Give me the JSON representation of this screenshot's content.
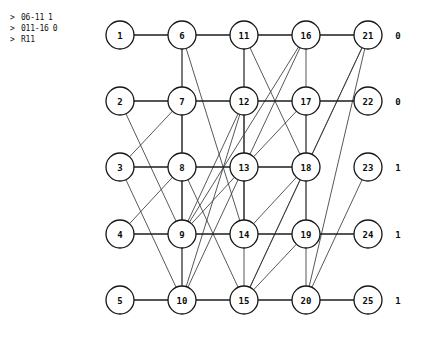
{
  "console": {
    "lines": [
      {
        "prompt": ">",
        "command": "06-11",
        "value": "1"
      },
      {
        "prompt": ">",
        "command": "011-16",
        "value": "0"
      },
      {
        "prompt": ">",
        "command": "R11",
        "value": ""
      }
    ]
  },
  "graph": {
    "title": "",
    "node_radius": 14,
    "columns": [
      120,
      182,
      244,
      306,
      368
    ],
    "rows": [
      35,
      101,
      167,
      234,
      300
    ],
    "row_labels": [
      "0",
      "0",
      "1",
      "1",
      "1"
    ],
    "nodes": [
      {
        "id": 1,
        "label": "1",
        "col": 0,
        "row": 0
      },
      {
        "id": 2,
        "label": "2",
        "col": 0,
        "row": 1
      },
      {
        "id": 3,
        "label": "3",
        "col": 0,
        "row": 2
      },
      {
        "id": 4,
        "label": "4",
        "col": 0,
        "row": 3
      },
      {
        "id": 5,
        "label": "5",
        "col": 0,
        "row": 4
      },
      {
        "id": 6,
        "label": "6",
        "col": 1,
        "row": 0
      },
      {
        "id": 7,
        "label": "7",
        "col": 1,
        "row": 1
      },
      {
        "id": 8,
        "label": "8",
        "col": 1,
        "row": 2
      },
      {
        "id": 9,
        "label": "9",
        "col": 1,
        "row": 3
      },
      {
        "id": 10,
        "label": "10",
        "col": 1,
        "row": 4
      },
      {
        "id": 11,
        "label": "11",
        "col": 2,
        "row": 0
      },
      {
        "id": 12,
        "label": "12",
        "col": 2,
        "row": 1
      },
      {
        "id": 13,
        "label": "13",
        "col": 2,
        "row": 2
      },
      {
        "id": 14,
        "label": "14",
        "col": 2,
        "row": 3
      },
      {
        "id": 15,
        "label": "15",
        "col": 2,
        "row": 4
      },
      {
        "id": 16,
        "label": "16",
        "col": 3,
        "row": 0
      },
      {
        "id": 17,
        "label": "17",
        "col": 3,
        "row": 1
      },
      {
        "id": 18,
        "label": "18",
        "col": 3,
        "row": 2
      },
      {
        "id": 19,
        "label": "19",
        "col": 3,
        "row": 3
      },
      {
        "id": 20,
        "label": "20",
        "col": 3,
        "row": 4
      },
      {
        "id": 21,
        "label": "21",
        "col": 4,
        "row": 0
      },
      {
        "id": 22,
        "label": "22",
        "col": 4,
        "row": 1
      },
      {
        "id": 23,
        "label": "23",
        "col": 4,
        "row": 2
      },
      {
        "id": 24,
        "label": "24",
        "col": 4,
        "row": 3
      },
      {
        "id": 25,
        "label": "25",
        "col": 4,
        "row": 4
      }
    ],
    "chain_edges": [
      [
        1,
        6
      ],
      [
        6,
        11
      ],
      [
        11,
        16
      ],
      [
        16,
        21
      ],
      [
        2,
        7
      ],
      [
        7,
        12
      ],
      [
        12,
        17
      ],
      [
        17,
        22
      ],
      [
        3,
        8
      ],
      [
        8,
        13
      ],
      [
        13,
        18
      ],
      [
        4,
        9
      ],
      [
        9,
        14
      ],
      [
        14,
        19
      ],
      [
        19,
        24
      ],
      [
        5,
        10
      ],
      [
        10,
        15
      ],
      [
        15,
        20
      ],
      [
        20,
        25
      ]
    ],
    "cross_edges": [
      [
        6,
        9
      ],
      [
        6,
        10
      ],
      [
        6,
        14
      ],
      [
        2,
        9
      ],
      [
        7,
        10
      ],
      [
        7,
        3
      ],
      [
        11,
        14
      ],
      [
        11,
        15
      ],
      [
        11,
        18
      ],
      [
        12,
        9
      ],
      [
        12,
        10
      ],
      [
        12,
        14
      ],
      [
        16,
        13
      ],
      [
        16,
        19
      ],
      [
        16,
        9
      ],
      [
        17,
        13
      ],
      [
        17,
        20
      ],
      [
        21,
        15
      ],
      [
        21,
        18
      ],
      [
        21,
        20
      ],
      [
        23,
        20
      ],
      [
        3,
        10
      ],
      [
        8,
        15
      ],
      [
        13,
        10
      ],
      [
        18,
        15
      ],
      [
        19,
        15
      ],
      [
        4,
        8
      ],
      [
        9,
        13
      ],
      [
        14,
        18
      ]
    ]
  }
}
